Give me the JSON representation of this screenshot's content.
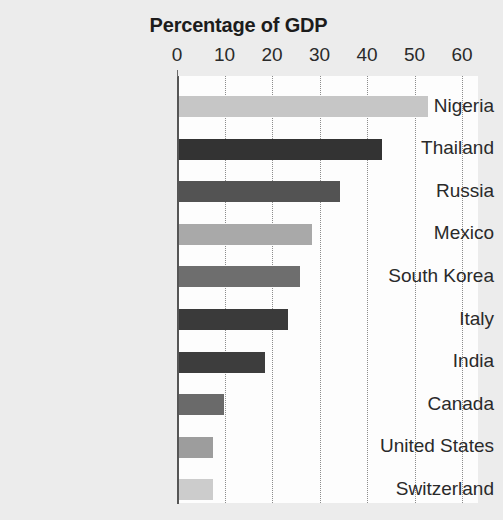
{
  "chart_data": {
    "type": "bar",
    "orientation": "horizontal",
    "title": "Percentage of GDP",
    "xlabel": "",
    "ylabel": "",
    "xlim": [
      0,
      60
    ],
    "ylim": null,
    "grid": true,
    "grid_style": "dotted vertical",
    "legend": null,
    "xticks": [
      0,
      10,
      20,
      30,
      40,
      50,
      60
    ],
    "xtick_labels": [
      "0",
      "10",
      "20",
      "30",
      "40",
      "50",
      "60"
    ],
    "categories": [
      "Nigeria",
      "Thailand",
      "Russia",
      "Mexico",
      "South Korea",
      "Italy",
      "India",
      "Canada",
      "United States",
      "Switzerland"
    ],
    "values": [
      52.8,
      43.2,
      34.3,
      28.4,
      25.9,
      23.4,
      18.5,
      9.9,
      7.6,
      7.6
    ],
    "bar_colors": [
      "#c6c6c6",
      "#333333",
      "#535353",
      "#a9a9a9",
      "#6e6e6e",
      "#3a3a3a",
      "#3d3d3d",
      "#6a6a6a",
      "#9d9d9d",
      "#cccccc"
    ],
    "plot_background": "#fdfdfd",
    "figure_background": "#ececec",
    "axis_color": "#555555",
    "text_color": "#2a2a2a"
  }
}
